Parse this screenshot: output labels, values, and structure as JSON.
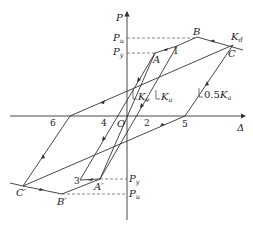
{
  "diagram": {
    "axes": {
      "y_label": "P",
      "x_label": "Δ",
      "origin_label": "O"
    },
    "force_levels": {
      "pu_pos": {
        "main": "P",
        "sub": "u"
      },
      "py_pos": {
        "main": "P",
        "sub": "y"
      },
      "py_neg": {
        "main": "P",
        "sub": "y"
      },
      "pu_neg": {
        "main": "P",
        "sub": "u"
      }
    },
    "points": {
      "A": "A",
      "B": "B",
      "C": "C",
      "A_prime": "A′",
      "B_prime": "B′",
      "C_prime": "C′",
      "p1": "1",
      "p2": "2",
      "p3": "3",
      "p4": "4",
      "p5": "5",
      "p6": "6"
    },
    "stiffness_labels": {
      "ke": {
        "main": "K",
        "sub": "e"
      },
      "ka": {
        "main": "K",
        "sub": "a"
      },
      "half_ka": {
        "prefix": "0.5",
        "main": "K",
        "sub": "a"
      },
      "kd": {
        "main": "K",
        "sub": "d"
      }
    },
    "colors": {
      "line": "#333333",
      "dashed": "#555555"
    }
  }
}
